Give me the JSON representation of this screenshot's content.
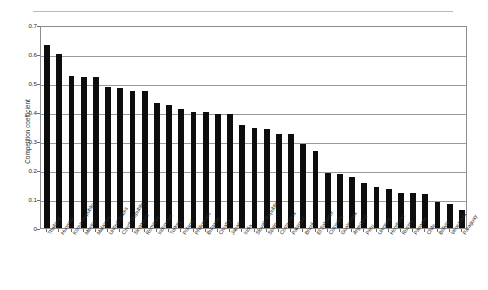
{
  "chart_data": {
    "type": "bar",
    "title": "",
    "subtitle": "",
    "xlabel": "",
    "ylabel": "Competition coefficient",
    "ylim": [
      0,
      0.7
    ],
    "ytick_labels": [
      "0",
      "0.1",
      "0.2",
      "0.3",
      "0.4",
      "0.5",
      "0.6",
      "0.7"
    ],
    "ytick_values": [
      0,
      0.1,
      0.2,
      0.3,
      0.4,
      0.5,
      0.6,
      0.7
    ],
    "grid": true,
    "legend": "none",
    "orientation": "vertical",
    "bar_color": "#0d0d0d",
    "categories": [
      "Thailand",
      "Hungary",
      "Korea Republic",
      "Mexico",
      "Malaysia",
      "United States",
      "Czech Republic",
      "Singapore",
      "Romania",
      "Indonesia",
      "Turkey",
      "Poland",
      "Philippines",
      "Bulgaria",
      "Croatia",
      "Japan",
      "India",
      "Slovak Republic",
      "Spain",
      "Costa Rica",
      "Pakistan",
      "Brazil",
      "El Salvador",
      "Colombia",
      "Guatemala",
      "Argentina",
      "Peru",
      "Uruguay",
      "Honduras",
      "Russia",
      "Panama",
      "Chile",
      "Bolivia",
      "Venezuela",
      "Paraguay"
    ],
    "values": [
      0.63,
      0.6,
      0.525,
      0.52,
      0.52,
      0.487,
      0.482,
      0.472,
      0.472,
      0.43,
      0.425,
      0.412,
      0.4,
      0.4,
      0.392,
      0.392,
      0.355,
      0.345,
      0.34,
      0.325,
      0.325,
      0.29,
      0.265,
      0.19,
      0.185,
      0.175,
      0.155,
      0.14,
      0.135,
      0.12,
      0.12,
      0.118,
      0.09,
      0.082,
      0.062
    ]
  }
}
